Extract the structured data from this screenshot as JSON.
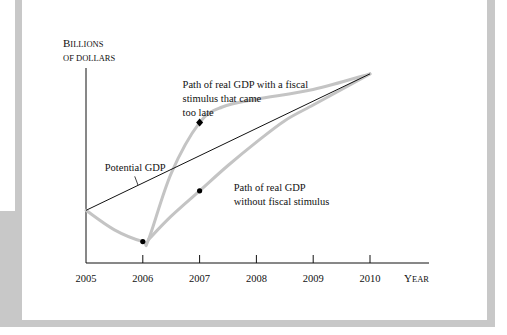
{
  "chart_data": {
    "type": "line",
    "title": "",
    "xlabel": "Year",
    "ylabel": "Billions of dollars",
    "ylabel_lines": [
      "Billions",
      "of dollars"
    ],
    "x_ticks": [
      "2005",
      "2006",
      "2007",
      "2008",
      "2009",
      "2010"
    ],
    "xlim": [
      2005,
      2010.7
    ],
    "ylim": [
      0,
      100
    ],
    "grid": false,
    "series": [
      {
        "name": "Potential GDP",
        "style": "thin-black",
        "points": [
          [
            2005,
            27
          ],
          [
            2010,
            97
          ]
        ]
      },
      {
        "name": "Path of real GDP with a fiscal stimulus that came too late",
        "style": "thick-gray",
        "points": [
          [
            2005,
            27
          ],
          [
            2005.5,
            17
          ],
          [
            2006,
            11
          ],
          [
            2006.1,
            12
          ],
          [
            2006.5,
            46
          ],
          [
            2007,
            72
          ],
          [
            2007.4,
            80
          ],
          [
            2008,
            84
          ],
          [
            2009,
            89
          ],
          [
            2010,
            97
          ]
        ]
      },
      {
        "name": "Path of real GDP without fiscal stimulus",
        "style": "thick-gray",
        "points": [
          [
            2006.1,
            12
          ],
          [
            2006.5,
            24
          ],
          [
            2007,
            37
          ],
          [
            2007.5,
            50
          ],
          [
            2008,
            62
          ],
          [
            2008.5,
            73
          ],
          [
            2009,
            81
          ],
          [
            2009.5,
            89
          ],
          [
            2010,
            97
          ]
        ]
      }
    ],
    "markers": [
      {
        "x": 2006,
        "y": 11,
        "shape": "circle"
      },
      {
        "x": 2007,
        "y": 72,
        "shape": "diamond"
      },
      {
        "x": 2007,
        "y": 37,
        "shape": "circle"
      }
    ],
    "annotations": [
      {
        "text_lines": [
          "Path of real GDP with a fiscal",
          "stimulus that came",
          "too late"
        ],
        "x": 2006.7,
        "y": 90
      },
      {
        "text_lines": [
          "Potential GDP"
        ],
        "x": 2005.33,
        "y": 47,
        "arrow_to": [
          2005.95,
          40
        ]
      },
      {
        "text_lines": [
          "Path of real GDP",
          "without fiscal stimulus"
        ],
        "x": 2007.6,
        "y": 37
      }
    ],
    "legend": "none"
  },
  "colors": {
    "frame": "#c8c8c8",
    "curve": "#c4c4c4",
    "line": "#111111",
    "marker": "#000000"
  }
}
